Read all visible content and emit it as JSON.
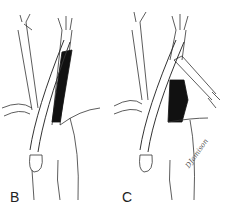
{
  "figure": {
    "panels": [
      {
        "id": "B",
        "label": "B",
        "description": "Graft routed from lower vessel upward alongside darkened (excluded) vessel segment"
      },
      {
        "id": "C",
        "label": "C",
        "description": "Graft crossing with branch to side vessel; darkened segment between graft limbs"
      }
    ],
    "signature": "DJamison",
    "colors": {
      "line": "#333333",
      "fill_dark": "#111111",
      "background": "#ffffff"
    }
  }
}
